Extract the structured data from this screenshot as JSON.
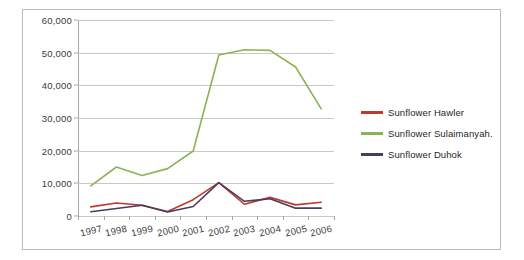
{
  "chart_data": {
    "type": "line",
    "title": "",
    "subtitle": "",
    "xlabel": "",
    "ylabel": "",
    "categories": [
      "1997",
      "1998",
      "1999",
      "2000",
      "2001",
      "2002",
      "2003",
      "2004",
      "2005",
      "2006"
    ],
    "ylim": [
      0,
      60000
    ],
    "ytick_labels": [
      "0",
      "10,000",
      "20,000",
      "30,000",
      "40,000",
      "50,000",
      "60,000"
    ],
    "ytick_values": [
      0,
      10000,
      20000,
      30000,
      40000,
      50000,
      60000
    ],
    "grid": true,
    "legend_position": "right",
    "series": [
      {
        "name": "Sunflower Hawler",
        "color": "#C0392B",
        "values": [
          2800,
          4000,
          3300,
          1400,
          5000,
          10200,
          3600,
          5700,
          3400,
          4200
        ]
      },
      {
        "name": "Sunflower Sulaimanyah.",
        "color": "#8DB255",
        "values": [
          9200,
          15000,
          12400,
          14500,
          19900,
          49300,
          50900,
          50700,
          45600,
          32800
        ]
      },
      {
        "name": "Sunflower Duhok",
        "color": "#4A3C5E",
        "values": [
          1300,
          2300,
          3300,
          1200,
          2900,
          10200,
          4500,
          5300,
          2400,
          2400
        ]
      }
    ]
  },
  "frame": {
    "border_color": "#b9bcbe",
    "background": "#ffffff",
    "gridline_color": "#c8c8c8",
    "axis_color": "#a6a6a6",
    "text_color": "#3a3a3a"
  }
}
